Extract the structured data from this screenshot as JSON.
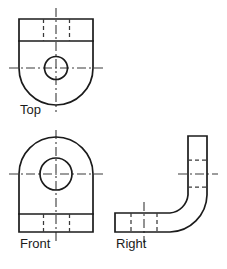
{
  "drawing": {
    "title": "Orthographic Projection - Three View Drawing",
    "background_color": "#ffffff",
    "object_line_color": "#1b1b1b",
    "hidden_line_color": "#3a3a3a",
    "center_line_color": "#3a3a3a",
    "views": [
      {
        "id": "top",
        "label": "Top",
        "label_x": 20,
        "label_y": 114,
        "description": "Top view: rectangular plate with rounded lower end and a through hole",
        "outline_path": "M19 19 L93 19 L93 68 A37 37 0 0 1 19 68 Z",
        "divider_line": {
          "x1": 19,
          "y1": 41,
          "x2": 93,
          "y2": 41
        },
        "circle": {
          "cx": 56,
          "cy": 68,
          "r": 11.5
        },
        "hidden_lines": [
          {
            "x1": 43.5,
            "y1": 19,
            "x2": 43.5,
            "y2": 41
          },
          {
            "x1": 69.5,
            "y1": 19,
            "x2": 69.5,
            "y2": 41
          }
        ],
        "center_lines": [
          {
            "x1": 56,
            "y1": 8,
            "x2": 56,
            "y2": 112
          },
          {
            "x1": 9,
            "y1": 68,
            "x2": 103,
            "y2": 68
          }
        ]
      },
      {
        "id": "front",
        "label": "Front",
        "label_x": 20,
        "label_y": 248,
        "description": "Front view: base block with semicircular top and concentric through hole",
        "outline_path": "M19 232 L19 174 A37 37 0 0 1 93 174 L93 232 Z",
        "divider_line": {
          "x1": 19,
          "y1": 214,
          "x2": 93,
          "y2": 214
        },
        "circle": {
          "cx": 56,
          "cy": 174,
          "r": 16
        },
        "inner_circle": {
          "cx": 56,
          "cy": 174,
          "r": 0
        },
        "hidden_lines": [
          {
            "x1": 43.5,
            "y1": 214,
            "x2": 43.5,
            "y2": 232
          },
          {
            "x1": 69.5,
            "y1": 214,
            "x2": 69.5,
            "y2": 232
          }
        ],
        "center_lines": [
          {
            "x1": 56,
            "y1": 130,
            "x2": 56,
            "y2": 243
          },
          {
            "x1": 9,
            "y1": 174,
            "x2": 103,
            "y2": 174
          }
        ]
      },
      {
        "id": "right",
        "label": "Right",
        "label_x": 116,
        "label_y": 248,
        "description": "Right side view: L-shaped bracket profile with filleted inner and outer bend",
        "outline_path": "M115 213 L170 213 A20 20 0 0 0 188 195 L188 136 L207 136 L207 195 A38 38 0 0 1 170 232 L115 232 Z",
        "hidden_lines": [
          {
            "x1": 188,
            "y1": 160,
            "x2": 207,
            "y2": 160
          },
          {
            "x1": 188,
            "y1": 187,
            "x2": 207,
            "y2": 187
          },
          {
            "x1": 131,
            "y1": 213,
            "x2": 131,
            "y2": 232
          },
          {
            "x1": 157,
            "y1": 213,
            "x2": 157,
            "y2": 232
          }
        ],
        "center_lines": [
          {
            "x1": 178,
            "y1": 174,
            "x2": 218,
            "y2": 174
          },
          {
            "x1": 144,
            "y1": 202,
            "x2": 144,
            "y2": 243
          }
        ]
      }
    ]
  },
  "labels": {
    "top": "Top",
    "front": "Front",
    "right": "Right"
  }
}
